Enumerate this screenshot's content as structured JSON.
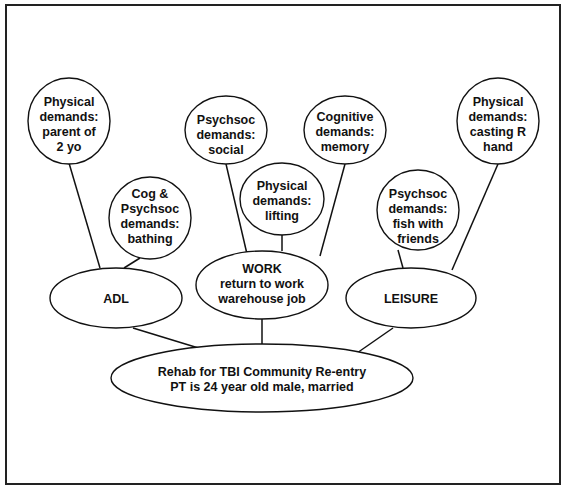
{
  "diagram": {
    "root": {
      "lines": [
        "Rehab for TBI Community Re-entry",
        "PT is 24 year old male, married"
      ]
    },
    "categories": [
      {
        "id": "adl",
        "lines": [
          "ADL"
        ]
      },
      {
        "id": "work",
        "lines": [
          "WORK",
          "return to work",
          "warehouse job"
        ]
      },
      {
        "id": "leisure",
        "lines": [
          "LEISURE"
        ]
      }
    ],
    "demands": [
      {
        "parent": "adl",
        "lines": [
          "Physical",
          "demands:",
          "parent of",
          "2 yo"
        ]
      },
      {
        "parent": "adl",
        "lines": [
          "Cog &",
          "Psychsoc",
          "demands:",
          "bathing"
        ]
      },
      {
        "parent": "work",
        "lines": [
          "Psychsoc",
          "demands:",
          "social"
        ]
      },
      {
        "parent": "work",
        "lines": [
          "Physical",
          "demands:",
          "lifting"
        ]
      },
      {
        "parent": "work",
        "lines": [
          "Cognitive",
          "demands:",
          "memory"
        ]
      },
      {
        "parent": "leisure",
        "lines": [
          "Psychsoc",
          "demands:",
          "fish with",
          "friends"
        ]
      },
      {
        "parent": "leisure",
        "lines": [
          "Physical",
          "demands:",
          "casting R",
          "hand"
        ]
      }
    ]
  }
}
